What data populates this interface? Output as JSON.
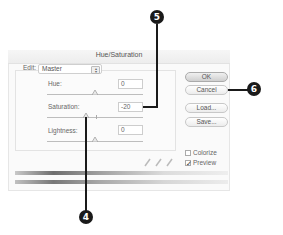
{
  "dialog": {
    "title": "Hue/Saturation",
    "edit": {
      "label": "Edit:",
      "selected": "Master"
    },
    "sliders": [
      {
        "label": "Hue:",
        "value": "0"
      },
      {
        "label": "Saturation:",
        "value": "-20"
      },
      {
        "label": "Lightness:",
        "value": "0"
      }
    ],
    "buttons": {
      "ok": "OK",
      "cancel": "Cancel",
      "load": "Load...",
      "save": "Save..."
    },
    "checkboxes": {
      "colorize": {
        "label": "Colorize",
        "checked": false
      },
      "preview": {
        "label": "Preview",
        "checked": true,
        "mark": "✓"
      }
    },
    "eyedroppers": [
      "eyedropper",
      "eyedropper-plus",
      "eyedropper-minus"
    ]
  },
  "callouts": {
    "saturation": "5",
    "cancel": "6",
    "saturation_slider": "4"
  },
  "colors": {
    "callout": "#1a1a1a",
    "dialog_bg": "#fafafa"
  }
}
